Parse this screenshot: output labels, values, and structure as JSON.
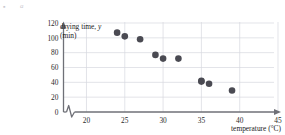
{
  "figure": {
    "part_bullet": "▪",
    "part_letter": "a"
  },
  "chart_data": {
    "type": "scatter",
    "title": "",
    "xlabel": "temperature (°C)",
    "ylabel_line1": "drying time, y",
    "ylabel_line2": "(min)",
    "ylabel_variable": "y",
    "xlim": [
      17,
      45
    ],
    "ylim": [
      0,
      120
    ],
    "xticks": [
      20,
      25,
      30,
      35,
      40,
      45
    ],
    "yticks": [
      0,
      20,
      40,
      60,
      80,
      100,
      120
    ],
    "xticklabels": [
      "20",
      "25",
      "30",
      "35",
      "40",
      "45"
    ],
    "yticklabels": [
      "0",
      "20",
      "40",
      "60",
      "80",
      "100",
      "120"
    ],
    "grid": true,
    "grid_color": "#d7d9e0",
    "axis_break_x": true,
    "axis_color": "#6f7077",
    "marker_color": "#4a4a52",
    "marker_size": 3.3,
    "legend": null,
    "x": [
      24,
      25,
      27,
      29,
      30,
      32,
      35,
      35,
      36,
      39
    ],
    "y": [
      107,
      102,
      98,
      77,
      72,
      72,
      42,
      41,
      38,
      29
    ],
    "points": [
      {
        "x": 24,
        "y": 107
      },
      {
        "x": 25,
        "y": 102
      },
      {
        "x": 27,
        "y": 98
      },
      {
        "x": 29,
        "y": 77
      },
      {
        "x": 30,
        "y": 72
      },
      {
        "x": 32,
        "y": 72
      },
      {
        "x": 35,
        "y": 42
      },
      {
        "x": 35,
        "y": 41
      },
      {
        "x": 36,
        "y": 38
      },
      {
        "x": 39,
        "y": 29
      }
    ]
  }
}
